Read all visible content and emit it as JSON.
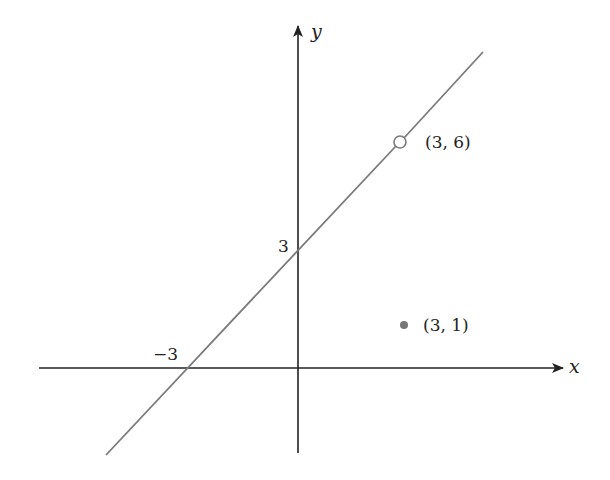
{
  "diagram": {
    "type": "coordinate-graph",
    "axes": {
      "x_label": "x",
      "y_label": "y",
      "color": "#222222"
    },
    "line": {
      "color": "#7a7a7a",
      "description": "line through (-3, 0) and (0, 3) with a hole at (3, 6)"
    },
    "labels": {
      "y_intercept": "3",
      "x_intercept": "−3",
      "open_point": "(3, 6)",
      "filled_point": "(3, 1)"
    },
    "points": [
      {
        "name": "open_point",
        "x": 3,
        "y": 6,
        "style": "open"
      },
      {
        "name": "filled_point",
        "x": 3,
        "y": 1,
        "style": "filled",
        "color": "#777777"
      }
    ]
  }
}
